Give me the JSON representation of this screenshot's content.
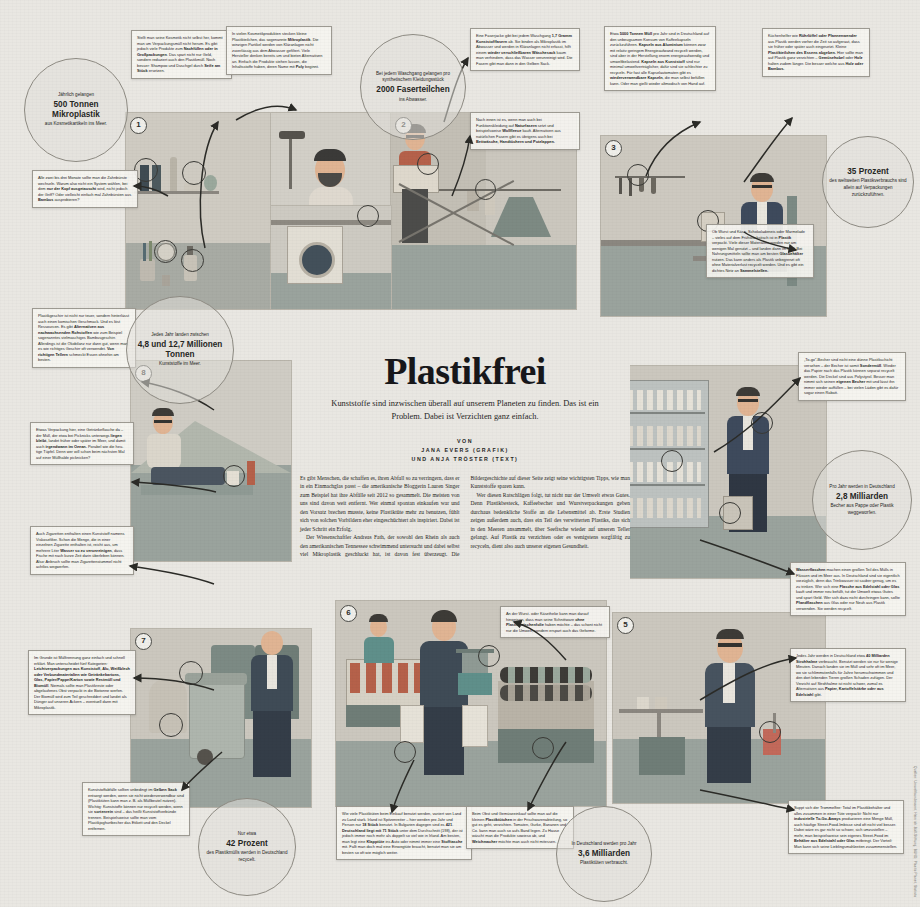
{
  "meta": {
    "language": "de",
    "palette": {
      "paper": "#e9e7e2",
      "panel": "#d8d5cd",
      "ink": "#26261f",
      "skin": "#e8b894",
      "teal": "#5f8f8a",
      "rust": "#b5614a",
      "navy": "#3e4a5c",
      "sage": "#9fa6a2"
    }
  },
  "headline": {
    "title": "Plastikfrei",
    "subtitle": "Kunststoffe sind inzwischen überall auf unserem Planeten zu finden. Das ist ein Problem. Dabei ist Verzichten ganz einfach.",
    "byline_label": "VON",
    "byline_author_1": "JANA EVERS (GRAFIK)",
    "byline_author_2": "UND ANJA TRÖSTER (TEXT)"
  },
  "article": {
    "paragraphs": [
      "Es gibt Menschen, die schaffen es, ihren Abfall so zu verringern, dass er in ein Einmachglas passt – die amerikanische Bloggerin Lauren Singer zum Beispiel hat ihre Abfälle seit 2012 so gesammelt. Die meisten von uns sind davon weit entfernt. Wer einmal spontan einkaufen war und den Vorsatz brechen musste, keine Plastiktüte mehr zu benutzen, fühlt sich von solchen Vorbildern eher eingeschüchtert als inspiriert. Dabei ist jeder Schritt ein Erfolg.",
      "Der Wissenschaftler Andreas Fath, der sowohl den Rhein als auch den amerikanischen Tennessee schwimmend untersucht und dabei selbst viel Mikroplastik geschluckt hat, ist davon fest überzeugt. Die Bildergeschichte auf dieser Seite zeigt seine wichtigsten Tipps, wie man Kunststoffe sparen kann.",
      "Wer diesen Ratschlägen folgt, tut nicht nur der Umwelt etwas Gutes. Denn Plastikbesteck, Kaffeebecher und Wurstverpackungen geben durchaus bedenkliche Stoffe an die Lebensmittel ab. Erste Studien zeigen außerdem auch, dass ein Teil des verwitterten Plastiks, das sich in den Meeren ansammelt, über Seefische wieder auf unseren Teller gelangt. Auf Plastik zu verzichten oder es wenigstens sorgfältig zu recyceln, dient also auch unserer eigenen Gesundheit."
    ]
  },
  "stat_circles": [
    {
      "id": "stat-mikroplastik",
      "lead": "Jährlich gelangen",
      "value": "500 Tonnen Mikroplastik",
      "trail": "aus Kosmetikartikeln ins Meer."
    },
    {
      "id": "stat-meer",
      "lead": "Jedes Jahr landen zwischen",
      "value": "4,8 und 12,7 Millionen Tonnen",
      "trail": "Kunststoffe im Meer."
    },
    {
      "id": "stat-fasern",
      "lead": "Bei jedem Waschgang gelangen pro synthetischem Kleidungsstück",
      "value": "2000 Faserteilchen",
      "trail": "ins Abwasser."
    },
    {
      "id": "stat-verpackungen",
      "lead": "",
      "value": "35 Prozent",
      "trail": "des weltweiten Plastikverbrauchs sind allein auf Verpackungen zurückzuführen."
    },
    {
      "id": "stat-becher",
      "lead": "Pro Jahr werden in Deutschland",
      "value": "2,8 Milliarden",
      "trail": "Becher aus Pappe oder Plastik weggeworfen."
    },
    {
      "id": "stat-recycling",
      "lead": "Nur etwa",
      "value": "42 Prozent",
      "trail": "des Plastikmülls werden in Deutschland recycelt."
    },
    {
      "id": "stat-tueten",
      "lead": "In Deutschland werden pro Jahr",
      "value": "3,6 Milliarden",
      "trail": "Plastiktüten verbraucht."
    }
  ],
  "callouts": [
    {
      "id": "callout-kosmetik-selbst",
      "text": "Stellt man seine Kosmetik nicht selbst her, kommt man um Verpackungsmüll nicht herum. Es gibt jedoch viele Produkte zum <b>Nachfüllen oder in Großpackungen</b>. Das spart nicht nur Geld, sondern reduziert auch den Plastikmüll. Noch besser: Shampoo und Duschgel durch <b>Seife am Stück</b> ersetzen."
    },
    {
      "id": "callout-mikroplastik-poly",
      "text": "In vielen Kosmetikprodukten stecken kleine Plastikteilchen, das sogenannte <b>Mikroplastik</b>. Die winzigen Partikel werden von Kläranlagen nicht zuverlässig aus dem Abwasser gefiltert. Viele Hersteller denken bereits um und bieten Alternativen an. Einfach die Produkte stehen lassen, die Inhaltsstoffe haben, deren Name mit <b>Poly</b> beginnt."
    },
    {
      "id": "callout-zahnbuerste",
      "text": "Alle zwei bis drei Monate sollte man die Zahnbürste wechseln. Warum also nicht ein System wählen, bei dem <b>nur der Kopf ausgetauscht</b> wird, nicht jedoch der Griff? Oder vielleicht einfach mal Zahnbürsten aus <b>Bambus</b> ausprobieren?"
    },
    {
      "id": "callout-waschgang",
      "text": "Eine Faserjacke gibt bei jedem Waschgang <b>1,7 Gramm Kunststofffasern</b> ab. Sie binden als Mikroplastik im Abwasser und werden in Kläranlagen nicht erfasst, hilft einem <b>wieder verschließbaren Wäschesack</b> kaum man verhindern, dass das Wasser verunreinigt wird. Die Fasern gibt man dann in den Gelben Sack."
    },
    {
      "id": "callout-naturfasern",
      "text": "Nach innen ist es, wenn man auch bei Funktionskleidung auf <b>Naturfasern</b> setzt und beispielsweise <b>Wollfleece</b> kauft. Alternativen aus natürlichen Fasern gibt es übrigens auch bei <b>Bettwäsche, Handtüchern und Putzlappen.</b>"
    },
    {
      "id": "callout-kapseln",
      "text": "Etwa <b>5000 Tonnen Müll</b> pro Jahr sind in Deutschland auf den unbeugsamen Konsum von Kaffeekapseln zurückzuführen. <b>Kapseln aus Aluminium</b> können zwar mit relativ geringem Energieaufwand recycelt werden, sind aber in der Herstellung enorm energieaufwendig und umweltbelastend. <b>Kapseln aus Kunststoff</b> sind nur minimal umweltverträglicher, dafür sind sie schlechter zu recyceln. Für fast alle Kapselautomaten gibt es <b>wiederverwendbare Kapseln</b>, die man selbst befüllen kann. Oder man gießt wieder altmodisch von Hand auf."
    },
    {
      "id": "callout-ruehrloeffel",
      "text": "Küchenhelfer wie <b>Rührlöffel oder Pfannenwender</b> aus Plastik werden vorher die Zeit so aufgeraut, dass sie früher oder später auch eingesetzt. Kleine <b>Plastikteilchen des Essens abgeben.</b> Hier sollte man auf Plastik ganz verzichten – <b>Gemüsehobel</b> oder <b>Holz</b> halten zudem länger. Die besser welche aus <b>Holz oder Bambus.</b>"
    },
    {
      "id": "callout-wurst-kaese",
      "text": "Ob Wurst und Käse, Schokoladeneis oder Marmelade – vieles auf dem Frühstückstisch ist in <b>Plastik</b> verpackt. Viele dieser Materialien werden nur am wenigen Mal genutzt – und landen dann im Müll. Bei Nahrungsmitteln sollte man am besten <b>Glasbehälter</b> nutzen. Das kann anders als Plastik unbegrenzt oft ohne Materialverlust recycelt werden. Und es gibt ein dichtes Netz an <b>Sammelstellen.</b>"
    },
    {
      "id": "callout-plastikgeschirr",
      "text": "Plastikgeschirr ist nicht nur teuer, sondern hinterlässt auch einen komischen Geschmack. Und es löst Ressourcen. Es gibt <b>Alternativen aus nachwachsenden Rohstoffen</b> wie zum Beispiel sogenanntes vielmaschiges Bambusgeschirr. Allerdings ist die Ökobilanz nur dann gut, wenn man es wie richtiges Geschirr oft verwendet. <b>Von richtigen Tellern</b> schmeckt Essen ohnehin am besten."
    },
    {
      "id": "callout-to-go",
      "text": "Etwas Verpackung hier, eine Getränkeflasche da – der Müll, der etwa bei Picknicks unterwegs <b>liegen bleibt</b>, landet früher oder später im Meer, und damit auch <b>irgendwann im Ozean.</b> Porabel wie die heu­tige Tüpfel. Denn wer will schon beim nächsten Mal auf einer Müllhalde picknicken?"
    },
    {
      "id": "callout-zigaretten",
      "text": "Auch Zigaretten enthalten einen Kunststoff namens Viskosefilter. Schon die Menge, die in einer einzelnen Zigarette enthalten ist, reicht aus, um mehrere Liter <b>Wasser so zu verunreinigen</b>, dass Fische mit nach kurze Zeit darin überleben können. Also: Anbruch sollte man Zigarettenstummel nicht achtlos wegwerfen."
    },
    {
      "id": "callout-muell-trennen",
      "text": "Im Grunde ist Mülltrennung ganz einfach und schnell erklärt. Man unterscheidet fünf Kategorien: <b>Leichtverpackungen aus Kunststoff, Alu, Weißblech oder Verbundmaterialien wie Getränkekartons, Glas, Papier/Pappe/Karton sowie Restmüll und Biomüll</b>. Niemals sollte man Plastikreste oder abgelaufenes Obst verpackt in die Biotonne werfen. Der Biomüll wird zum Teil geschreddert und landet als Dünger auf unseren Äckern – eventuell dann mit Mikroplastik."
    },
    {
      "id": "callout-gelber-sack",
      "text": "Kunststoffabfälle sollten unbedingt im <b>Gelben Sack</b> entsorgt werden, wenn sie nicht wiederverwendbar sind (Plastiktüten kann man z. B. als Müllbeutel nutzen). Wichtig: Kunststoffe können nur recycelt werden, wenn sie <b>sortenrein</b> sind – das heißt Kunststoffverbünde trennen. Beispielsweise sollte man vom Plastikjoghurtbecher das Etikett und den Deckel entfernen."
    },
    {
      "id": "callout-plastiktueten-einkauf",
      "text": "Wie viele Plastiktüten beim Einkauf benutzt werden, variiert von Land zu Land stark. Irland ist Spitzenreiter – hier werden pro Jahr und Person nur <b>18 Stück</b> benutzt. In Bulgarien dagegen sind es <b>421</b>. <b>Deutschland liegt mit 71 Stück</b> unter dem Durchschnitt (198), der ist jedoch immer noch mehr als doppelt so viel wie in Irland. Am besten, man legt eine <b>Klapptüte</b> ins Auto oder nimmt immer eine <b>Stofftasche</b> mit. Fallt man doch mal eine Einwegtüte braucht, benutzt man sie am besten so oft wie möglich weiter."
    },
    {
      "id": "callout-wurst-kaesetheke",
      "text": "An der Wurst- oder Käsetheke kann man darauf hinweisen, dass man seine Schnittware <b>ohne Plastikzwischenfolie</b> haben möchte – das schont nicht nur die Umwelt, sondern erspart auch das Geforme."
    },
    {
      "id": "callout-obst-gemuese",
      "text": "Beim Obst und Gemüseeinkauf sollte man auf die kleinen <b>Plastiktütchen</b> in der Frischwarenabteilung, so gut es geht, verzichten. Tomaten, Gurke, Bananen und Co. kann man auch so aufs Band legen. Zu Hause wäscht man die Produkte sowieso ab, und <b>Weichmacher</b> möchte man auch nicht mitessen."
    },
    {
      "id": "callout-strohhalme",
      "text": "Jedes Jahr werden in Deutschland etwa <b>40 Milliarden Strohhalme</b> verbraucht. Benutzt werden sie nur für wenige Minuten. Danach landen sie im Müll und sehr oft im Meer, wo sie schlimmstenfalls für Jahre herumschwimmen und den dort lebenden Tieren großen Schaden zufügen. Der Verzicht auf Strohhalme ist nicht schwer, zumal es Alternativen aus <b>Papier, Kartoffelstärke oder aus Edelstahl</b> gibt."
    },
    {
      "id": "callout-coffee-to-go",
      "text": "Suppt sich der Trommelfee: Total im Plastikbehälter und alles zusammen in einer Tüte verpackt: Nicht nur <b>industrielle To-Go-Aways</b> produzieren eine Menge Müll, auch häufige Street-Food-Imbisse sind oft nicht viel besser. Dabei wäre es gar nicht so schwer, sich umzustellen – mehr, man beispielsweise sein eigenes Street-Food im <b>Behälter aus Edelstahl oder Glas</b> mitbringt. Der Vorteil: Man kann sich seine Lieblingsmahlzeiten zusammenstellen."
    },
    {
      "id": "callout-bio-becher",
      "text": "„To-go“-Becher sind nicht eine dünne Plastikschicht versehen – der Becher ist somit <b>Sondermüll</b>. Wieder das Papier nach das Plastik können separat recycelt werden. Die Deckel sind aus Polystyrol. Besser man nimmt sich seinen <b>eigenen Becher</b> mit und lässt ihn immer wieder auffüllen – bei vielen Läden gibt es dafür sogar einen Rabatt."
    },
    {
      "id": "callout-wasserflaschen",
      "text": "<b>Wasserflaschen</b> machen einen großen Teil des Mülls in Flüssen und im Meer aus. In Deutschland sind sie eigentlich vorzüglich, denn das Trinkwasser ist sauber genug, um es zu trinken. Wer sich eine <b>Flasche aus Edelstahl oder Glas</b> kauft und immer neu befüllt, tut der Umwelt etwas Gutes und spart Geld. Wer sich dazu nicht durchringen kann, sollte <b>Pfandflaschen</b> aus Glas oder nur Neuh aus Plastik verwenden. Sie werden recycelt."
    }
  ],
  "scene_numbers": [
    "1",
    "2",
    "3",
    "4",
    "5",
    "6",
    "7",
    "8"
  ],
  "credit": "Quellen: Umweltbundesamt, Heinrich-Böll-Stiftung, BUND, Plastic Planet, Statista"
}
